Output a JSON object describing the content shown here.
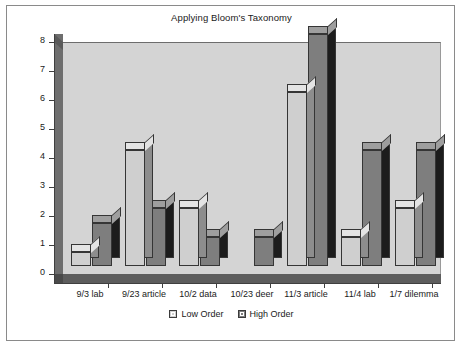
{
  "chart_data": {
    "type": "bar",
    "title": "Applying Bloom's Taxonomy",
    "xlabel": "",
    "ylabel": "Number of Questions",
    "ylim": [
      0,
      8
    ],
    "yticks": [
      "0",
      "1",
      "2",
      "3",
      "4",
      "5",
      "6",
      "7",
      "8"
    ],
    "grid": false,
    "legend_position": "bottom",
    "style": "3d-clustered-column",
    "categories": [
      "9/3 lab",
      "9/23 article",
      "10/2 data",
      "10/23 deer",
      "11/3 article",
      "11/4 lab",
      "1/7 dilemma"
    ],
    "series": [
      {
        "name": "Low Order",
        "color": "#cfcfcf",
        "values": [
          0.5,
          4,
          2,
          0,
          6,
          1,
          2
        ]
      },
      {
        "name": "High Order",
        "color": "#7e7e7e",
        "values": [
          1.5,
          2,
          1,
          1,
          8,
          4,
          4
        ]
      }
    ]
  },
  "colors": {
    "plot_background": "#d4d4d4",
    "figure_background": "#ffffff",
    "frame_border": "#8a8a8a",
    "axis": "#3f3f3f",
    "low_order": "#cfcfcf",
    "high_order": "#7e7e7e"
  }
}
